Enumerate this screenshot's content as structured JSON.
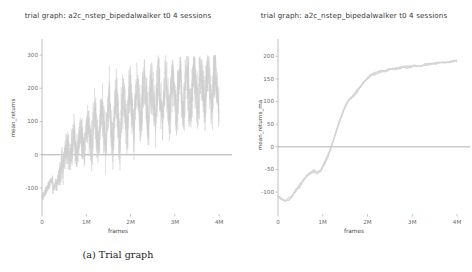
{
  "figure": {
    "panels": [
      {
        "id": "panel-a",
        "caption": "(a) Trial graph",
        "chart_data": {
          "type": "line",
          "title": "trial graph: a2c_nstep_bipedalwalker t0 4 sessions",
          "xlabel": "frames",
          "ylabel": "mean_returns",
          "xlim": [
            0,
            4200000
          ],
          "ylim": [
            -160,
            330
          ],
          "xticks": [
            0,
            1000000,
            2000000,
            3000000,
            4000000
          ],
          "xticklabels": [
            "0",
            "1M",
            "2M",
            "3M",
            "4M"
          ],
          "yticks": [
            -100,
            0,
            100,
            200,
            300
          ],
          "yticklabels": [
            "-100",
            "0",
            "100",
            "200",
            "300"
          ],
          "grid": false,
          "legend": "none",
          "line_color": "#cfcfcf",
          "zero_line_color": "#999999",
          "series": [
            {
              "name": "mean_returns",
              "description": "raw noisy per-checkpoint mean return, 4 sessions overlaid",
              "x": [
                0,
                40000,
                80000,
                120000,
                160000,
                200000,
                240000,
                280000,
                320000,
                360000,
                400000,
                440000,
                480000,
                520000,
                560000,
                600000,
                640000,
                680000,
                720000,
                760000,
                800000,
                840000,
                880000,
                920000,
                960000,
                1000000,
                1040000,
                1080000,
                1120000,
                1160000,
                1200000,
                1240000,
                1280000,
                1320000,
                1360000,
                1400000,
                1440000,
                1480000,
                1520000,
                1560000,
                1600000,
                1640000,
                1680000,
                1720000,
                1760000,
                1800000,
                1840000,
                1880000,
                1920000,
                1960000,
                2000000,
                2040000,
                2080000,
                2120000,
                2160000,
                2200000,
                2240000,
                2280000,
                2320000,
                2360000,
                2400000,
                2440000,
                2480000,
                2520000,
                2560000,
                2600000,
                2640000,
                2680000,
                2720000,
                2760000,
                2800000,
                2840000,
                2880000,
                2920000,
                2960000,
                3000000,
                3040000,
                3080000,
                3120000,
                3160000,
                3200000,
                3240000,
                3280000,
                3320000,
                3360000,
                3400000,
                3440000,
                3480000,
                3520000,
                3560000,
                3600000,
                3640000,
                3680000,
                3720000,
                3760000,
                3800000,
                3840000,
                3880000,
                3920000,
                3960000,
                4000000
              ],
              "y": [
                -132,
                -118,
                -128,
                -112,
                -124,
                -104,
                -110,
                -95,
                -88,
                -76,
                -60,
                -40,
                -22,
                5,
                28,
                12,
                -8,
                30,
                55,
                20,
                -5,
                45,
                80,
                35,
                10,
                70,
                105,
                50,
                15,
                95,
                130,
                60,
                20,
                110,
                155,
                75,
                25,
                125,
                170,
                85,
                30,
                140,
                185,
                100,
                40,
                150,
                195,
                115,
                60,
                165,
                205,
                125,
                70,
                175,
                215,
                135,
                80,
                185,
                220,
                145,
                95,
                190,
                225,
                150,
                100,
                195,
                230,
                155,
                105,
                200,
                235,
                160,
                110,
                205,
                240,
                165,
                115,
                210,
                245,
                170,
                120,
                215,
                250,
                175,
                125,
                220,
                255,
                180,
                130,
                225,
                258,
                185,
                135,
                230,
                262,
                190,
                140,
                235,
                265,
                195,
                145
              ]
            }
          ]
        }
      },
      {
        "id": "panel-b",
        "caption": "(b) Trial graph with moving average",
        "chart_data": {
          "type": "line",
          "title": "trial graph: a2c_nstep_bipedalwalker t0 4 sessions",
          "xlabel": "frames",
          "ylabel": "mean_returns_ma",
          "xlim": [
            0,
            4200000
          ],
          "ylim": [
            -135,
            225
          ],
          "xticks": [
            0,
            1000000,
            2000000,
            3000000,
            4000000
          ],
          "xticklabels": [
            "0",
            "1M",
            "2M",
            "3M",
            "4M"
          ],
          "yticks": [
            -100,
            -50,
            0,
            50,
            100,
            150,
            200
          ],
          "yticklabels": [
            "-100",
            "-50",
            "0",
            "50",
            "100",
            "150",
            "200"
          ],
          "grid": false,
          "legend": "none",
          "line_color": "#d4d4d4",
          "zero_line_color": "#999999",
          "series": [
            {
              "name": "mean_returns_ma",
              "description": "moving average of mean returns, 4 sessions overlaid",
              "x": [
                0,
                80000,
                160000,
                240000,
                320000,
                400000,
                480000,
                560000,
                640000,
                720000,
                800000,
                880000,
                960000,
                1040000,
                1120000,
                1200000,
                1280000,
                1360000,
                1440000,
                1520000,
                1600000,
                1680000,
                1760000,
                1840000,
                1920000,
                2000000,
                2080000,
                2160000,
                2240000,
                2320000,
                2400000,
                2480000,
                2560000,
                2640000,
                2720000,
                2800000,
                2880000,
                2960000,
                3040000,
                3120000,
                3200000,
                3280000,
                3360000,
                3440000,
                3520000,
                3600000,
                3680000,
                3760000,
                3840000,
                3920000,
                4000000
              ],
              "y": [
                -110,
                -116,
                -118,
                -115,
                -108,
                -98,
                -86,
                -74,
                -62,
                -56,
                -54,
                -56,
                -50,
                -36,
                -18,
                4,
                28,
                52,
                74,
                92,
                106,
                112,
                122,
                134,
                144,
                152,
                158,
                162,
                164,
                166,
                168,
                170,
                172,
                173,
                174,
                175,
                176,
                177,
                178,
                179,
                180,
                181,
                182,
                183,
                184,
                185,
                186,
                187,
                188,
                189,
                190
              ]
            }
          ]
        }
      }
    ]
  }
}
